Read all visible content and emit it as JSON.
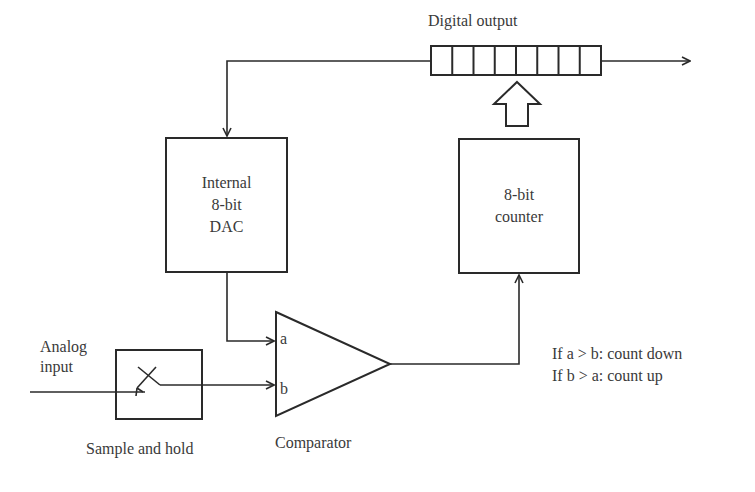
{
  "diagram": {
    "type": "block-diagram",
    "stroke_color": "#2a2a2a",
    "text_color": "#3a3a3a",
    "blocks": {
      "dac": {
        "label_lines": [
          "Internal",
          "8-bit",
          "DAC"
        ]
      },
      "counter": {
        "label_lines": [
          "8-bit",
          "counter"
        ]
      },
      "sample_hold": {
        "label": "Sample and hold"
      },
      "comparator": {
        "label": "Comparator",
        "input_a": "a",
        "input_b": "b"
      },
      "register": {
        "label": "Digital output",
        "cells": 8
      }
    },
    "analog_input": {
      "label_lines": [
        "Analog",
        "input"
      ]
    },
    "rules": [
      "If a > b: count down",
      "If b > a: count up"
    ]
  }
}
